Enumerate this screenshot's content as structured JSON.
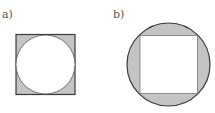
{
  "figures": [
    {
      "label": "a)",
      "description": "Circle inscribed in a square; corners between square and circle shaded",
      "outer_shape": "square",
      "inner_shape": "circle"
    },
    {
      "label": "b)",
      "description": "Square inscribed in a circle; segments between circle and square shaded",
      "outer_shape": "circle",
      "inner_shape": "square"
    }
  ],
  "colors": {
    "shade": "#c4c4c4",
    "stroke": "#3a3a3a",
    "fill_inner": "#ffffff"
  }
}
